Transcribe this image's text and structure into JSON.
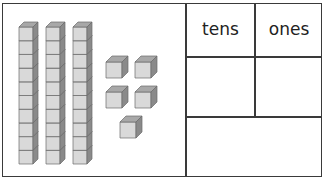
{
  "diagram": {
    "type": "place-value-chart",
    "blocks": {
      "tens_rods": 3,
      "cubes_per_rod": 10,
      "ones_cubes": 5
    },
    "table": {
      "headers": [
        "tens",
        "ones"
      ],
      "answer_cells": [
        "",
        ""
      ],
      "total_cell": ""
    },
    "colors": {
      "front": "#d9d9d9",
      "top": "#a8a8a8",
      "side": "#8a8a8a",
      "edge": "#6a6a6a",
      "border": "#3a3a3a"
    }
  }
}
